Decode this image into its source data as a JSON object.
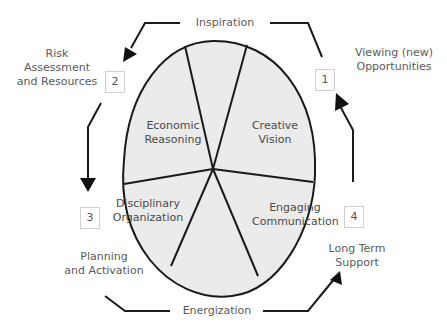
{
  "diagram": {
    "center_segments": [
      {
        "label_line1": "Economic",
        "label_line2": "Reasoning"
      },
      {
        "label_line1": "Creative",
        "label_line2": "Vision"
      },
      {
        "label_line1": "Disciplinary",
        "label_line2": "Organization"
      },
      {
        "label_line1": "Engaging",
        "label_line2": "Communication"
      }
    ],
    "steps": [
      {
        "number": "1",
        "label_line1": "Viewing (new)",
        "label_line2": "Opportunities"
      },
      {
        "number": "2",
        "label_line1": "Risk",
        "label_line2": "Assessment",
        "label_line3": "and Resources"
      },
      {
        "number": "3",
        "label_line1": "Planning",
        "label_line2": "and Activation"
      },
      {
        "number": "4",
        "label_line1": "Long Term",
        "label_line2": "Support"
      }
    ],
    "transitions": {
      "top": "Inspiration",
      "bottom": "Energization"
    },
    "colors": {
      "fill": "#ebebeb",
      "stroke": "#1a1a1a",
      "text": "#555555"
    }
  }
}
